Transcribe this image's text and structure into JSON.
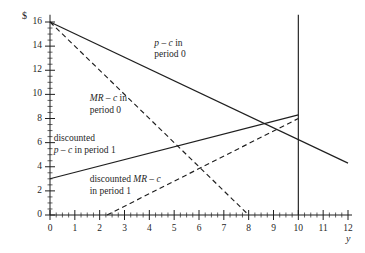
{
  "chart_data": {
    "type": "line",
    "title": "",
    "xlabel": "y",
    "ylabel": "$",
    "xlim": [
      0,
      12
    ],
    "ylim": [
      0,
      16
    ],
    "grid": false,
    "legend_position": "inline-annotations",
    "x_ticks": [
      "0",
      "1",
      "2",
      "3",
      "4",
      "5",
      "6",
      "7",
      "8",
      "9",
      "10",
      "11",
      "12"
    ],
    "y_ticks": [
      "0",
      "2",
      "4",
      "6",
      "8",
      "10",
      "12",
      "14",
      "16"
    ],
    "x_minor_step": 0.25,
    "y_minor_step": 0.5,
    "series": [
      {
        "name": "p − c in period 0",
        "style": "solid",
        "color": "#1f1f1f",
        "points": [
          [
            0,
            16
          ],
          [
            12,
            4.3
          ]
        ]
      },
      {
        "name": "MR − c in period 0",
        "style": "dashed",
        "color": "#1f1f1f",
        "points": [
          [
            0,
            16
          ],
          [
            8,
            0
          ]
        ]
      },
      {
        "name": "discounted p − c in period 1",
        "style": "solid",
        "color": "#1f1f1f",
        "points": [
          [
            0,
            3
          ],
          [
            10,
            8.3
          ]
        ]
      },
      {
        "name": "discounted MR − c in period 1",
        "style": "dashed",
        "color": "#1f1f1f",
        "points": [
          [
            2.3,
            0
          ],
          [
            10,
            8.0
          ]
        ]
      },
      {
        "name": "vertical reference at y = 10",
        "style": "solid",
        "color": "#1f1f1f",
        "points": [
          [
            10,
            0
          ],
          [
            10,
            16.6
          ]
        ]
      }
    ],
    "annotations": [
      {
        "id": "ann-pc0",
        "line1": "p − c in",
        "line2": "period 0",
        "x": 4.2,
        "y": 14.2
      },
      {
        "id": "ann-mrc0",
        "line1": "MR − c in",
        "line2": "period 0",
        "x": 1.6,
        "y": 9.6
      },
      {
        "id": "ann-dpc1",
        "line1": "discounted",
        "line2": "p − c in period 1",
        "x": 0.15,
        "y": 6.3
      },
      {
        "id": "ann-dmrc1",
        "line1": "discounted MR − c",
        "line2": "in period 1",
        "x": 1.6,
        "y": 2.9
      }
    ]
  },
  "axis_labels": {
    "y_axis_symbol": "$",
    "x_axis_symbol": "y"
  },
  "annotation_text": {
    "pc0_l1": "p – c in",
    "pc0_l2": "period 0",
    "mrc0_l1": "MR – c in",
    "mrc0_l2": "period 0",
    "dpc1_l1": "discounted",
    "dpc1_l2": "p – c in period 1",
    "dmrc1_l1": "discounted MR – c",
    "dmrc1_l2": "in period 1"
  }
}
